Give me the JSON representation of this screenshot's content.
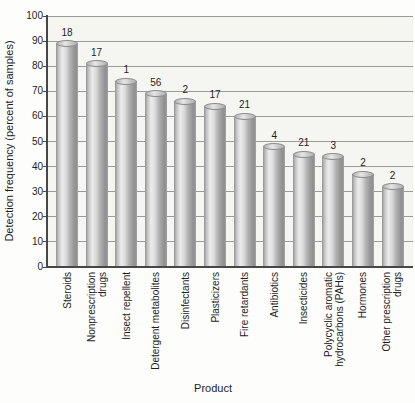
{
  "chart_data": {
    "type": "bar",
    "title": "",
    "xlabel": "Product",
    "ylabel": "Detection frequency (percent of samples)",
    "ylim": [
      0,
      100
    ],
    "yticks": [
      0,
      10,
      20,
      30,
      40,
      50,
      60,
      70,
      80,
      90,
      100
    ],
    "grid": "horizontal",
    "legend": "none",
    "bar_style": "3d-cylinder-gray",
    "categories": [
      "Steroids",
      "Nonprescription drugs",
      "Insect repellent",
      "Detergent metabolites",
      "Disinfectants",
      "Plasticizers",
      "Fire retardants",
      "Antibiotics",
      "Insecticides",
      "Polycyclic aromatic hydrocarbons (PAHs)",
      "Hormones",
      "Other prescription drugs"
    ],
    "category_label_lines": [
      [
        "Steroids"
      ],
      [
        "Nonprescription",
        "drugs"
      ],
      [
        "Insect repellent"
      ],
      [
        "Detergent metabolites"
      ],
      [
        "Disinfectants"
      ],
      [
        "Plasticizers"
      ],
      [
        "Fire retardants"
      ],
      [
        "Antibiotics"
      ],
      [
        "Insecticides"
      ],
      [
        "Polycyclic aromatic",
        "hydrocarbons (PAHs)"
      ],
      [
        "Hormones"
      ],
      [
        "Other prescription",
        "drugs"
      ]
    ],
    "values": [
      89,
      81,
      74,
      69,
      66,
      64,
      60,
      48,
      45,
      44,
      37,
      32
    ],
    "bar_value_labels": [
      "18",
      "17",
      "1",
      "56",
      "2",
      "17",
      "21",
      "4",
      "21",
      "3",
      "2",
      "2"
    ],
    "colors": {
      "page_background": "#fdfdfb",
      "plot_background": "#f5f5f2",
      "grid_line": "#9b9b9b",
      "axis_line": "#474747",
      "text": "#1e1e1e",
      "bar_edge": "#8b8b8b",
      "bar_mid": "#b5b5b5",
      "bar_highlight": "#ececec"
    }
  }
}
